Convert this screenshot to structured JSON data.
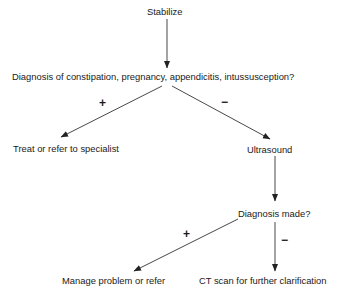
{
  "diagram": {
    "type": "flowchart",
    "colors": {
      "line": "#333333",
      "text": "#1a1a1a",
      "background": "#ffffff"
    },
    "nodes": {
      "stabilize": "Stabilize",
      "initial_diagnosis": "Diagnosis of constipation, pregnancy, appendicitis, intussusception?",
      "treat_refer": "Treat or refer to specialist",
      "ultrasound": "Ultrasound",
      "diagnosis_made": "Diagnosis made?",
      "manage_refer": "Manage problem or refer",
      "ct_scan": "CT scan for further clarification"
    },
    "edge_labels": {
      "initial_positive": "+",
      "initial_negative": "−",
      "made_positive": "+",
      "made_negative": "−"
    },
    "edges": [
      {
        "from": "stabilize",
        "to": "initial_diagnosis",
        "label": ""
      },
      {
        "from": "initial_diagnosis",
        "to": "treat_refer",
        "label": "+"
      },
      {
        "from": "initial_diagnosis",
        "to": "ultrasound",
        "label": "−"
      },
      {
        "from": "ultrasound",
        "to": "diagnosis_made",
        "label": ""
      },
      {
        "from": "diagnosis_made",
        "to": "manage_refer",
        "label": "+"
      },
      {
        "from": "diagnosis_made",
        "to": "ct_scan",
        "label": "−"
      }
    ]
  }
}
